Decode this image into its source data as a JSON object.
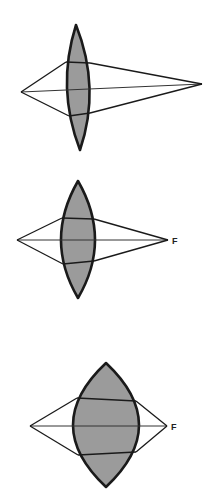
{
  "figure": {
    "width": 209,
    "height": 499,
    "colors": {
      "lens_fill": "#9b9b9b",
      "stroke": "#1a1a1a",
      "background": "#ffffff"
    },
    "lenses": [
      {
        "id": "lens-1",
        "label": "",
        "path": "M76,25 Q56,88 80,150 Q101,88 76,25 Z",
        "object_point": [
          21,
          92
        ],
        "focus_point": [
          202,
          84
        ],
        "rays": {
          "top_left": [
            21,
            92,
            66,
            62
          ],
          "top_inner": [
            66,
            62,
            90,
            63
          ],
          "top_right": [
            90,
            63,
            202,
            84
          ],
          "bottom_left": [
            21,
            92,
            69,
            116
          ],
          "bottom_inner": [
            69,
            116,
            90,
            113
          ],
          "bottom_right": [
            90,
            113,
            202,
            84
          ],
          "axis": [
            21,
            92,
            202,
            84
          ]
        }
      },
      {
        "id": "lens-2",
        "label": "F",
        "label_pos": [
          172,
          244
        ],
        "path": "M78,181 Q44,240 78,298 Q112,240 78,181 Z",
        "object_point": [
          17,
          240
        ],
        "focus_point": [
          168,
          240
        ],
        "rays": {
          "top_left": [
            17,
            240,
            62,
            218
          ],
          "top_inner": [
            62,
            218,
            94,
            219
          ],
          "top_right": [
            94,
            219,
            168,
            240
          ],
          "bottom_left": [
            17,
            240,
            63,
            264
          ],
          "bottom_inner": [
            63,
            264,
            94,
            261
          ],
          "bottom_right": [
            94,
            261,
            168,
            240
          ],
          "axis": [
            17,
            240,
            168,
            240
          ]
        }
      },
      {
        "id": "lens-3",
        "label": "F",
        "label_pos": [
          171,
          430
        ],
        "path": "M106,363 Q40,425 106,487 Q172,425 106,363 Z",
        "object_point": [
          30,
          426
        ],
        "focus_point": [
          167,
          426
        ],
        "rays": {
          "top_left": [
            30,
            426,
            77,
            398
          ],
          "top_inner": [
            77,
            398,
            136,
            401
          ],
          "top_right": [
            136,
            401,
            167,
            426
          ],
          "bottom_left": [
            30,
            426,
            78,
            455
          ],
          "bottom_inner": [
            78,
            455,
            136,
            452
          ],
          "bottom_right": [
            136,
            452,
            167,
            426
          ],
          "axis": [
            30,
            426,
            167,
            426
          ]
        }
      }
    ]
  }
}
